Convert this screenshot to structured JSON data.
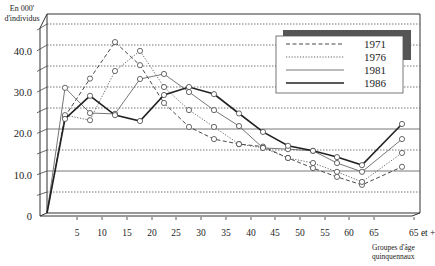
{
  "chart_data": {
    "type": "line",
    "title": "",
    "ylabel": "En 000' d'individus",
    "ylabel_lines": [
      "En 000'",
      "d'individus"
    ],
    "xlabel": "Groupes d'âge quinquennaux",
    "xlabel_lines": [
      "Groupes d'âge",
      "quinquennaux"
    ],
    "ylim": [
      0,
      40
    ],
    "yticks": [
      0,
      10,
      20,
      30,
      40
    ],
    "ytick_labels": [
      "0",
      "10.0",
      "20.0",
      "30.0",
      "40.0"
    ],
    "categories": [
      "0",
      "5",
      "10",
      "15",
      "20",
      "25",
      "30",
      "35",
      "40",
      "45",
      "50",
      "55",
      "60",
      "65",
      "65 et +"
    ],
    "xtick_labels": [
      "5",
      "10",
      "15",
      "20",
      "25",
      "30",
      "35",
      "40",
      "45",
      "50",
      "55",
      "60",
      "65",
      "65 et +"
    ],
    "grid": true,
    "legend_position": "top-right",
    "series": [
      {
        "name": "1971",
        "style": "dashed",
        "values": [
          0,
          23.0,
          32.0,
          40.7,
          35.2,
          26.2,
          20.5,
          17.6,
          16.4,
          15.8,
          13.1,
          10.7,
          8.6,
          6.7,
          11.0
        ]
      },
      {
        "name": "1976",
        "style": "dotted",
        "values": [
          0,
          23.3,
          22.1,
          33.8,
          38.6,
          30.0,
          24.5,
          20.5,
          16.4,
          15.5,
          13.1,
          11.9,
          9.8,
          7.4,
          14.3
        ]
      },
      {
        "name": "1981",
        "style": "thin",
        "values": [
          0,
          29.8,
          23.8,
          23.6,
          31.9,
          33.1,
          28.8,
          24.5,
          20.7,
          15.5,
          15.2,
          14.8,
          11.9,
          9.8,
          17.6
        ]
      },
      {
        "name": "1986",
        "style": "thick",
        "values": [
          0,
          22.4,
          27.9,
          23.3,
          21.9,
          28.1,
          30.0,
          28.3,
          23.7,
          19.3,
          16.0,
          14.8,
          13.3,
          11.4,
          21.2
        ]
      }
    ]
  }
}
